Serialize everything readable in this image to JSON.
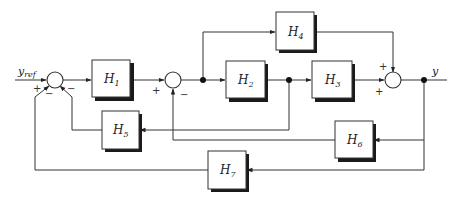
{
  "diagram": {
    "type": "block-diagram",
    "signals": {
      "input": {
        "name": "y",
        "subscript": "ref"
      },
      "output": {
        "name": "y"
      }
    },
    "blocks": [
      {
        "id": "H1",
        "name": "H",
        "sub": "1"
      },
      {
        "id": "H2",
        "name": "H",
        "sub": "2"
      },
      {
        "id": "H3",
        "name": "H",
        "sub": "3"
      },
      {
        "id": "H4",
        "name": "H",
        "sub": "4"
      },
      {
        "id": "H5",
        "name": "H",
        "sub": "5"
      },
      {
        "id": "H6",
        "name": "H",
        "sub": "6"
      },
      {
        "id": "H7",
        "name": "H",
        "sub": "7"
      }
    ],
    "summing_junctions": [
      {
        "id": "S1",
        "signs": {
          "left": "+",
          "bottom_left": "−",
          "bottom_right": "−"
        }
      },
      {
        "id": "S2",
        "signs": {
          "left": "+",
          "bottom": "−"
        }
      },
      {
        "id": "S3",
        "signs": {
          "top": "+",
          "left": "+"
        }
      }
    ],
    "connections": [
      "y_ref → S1 (+)",
      "S1 → H1",
      "H1 → S2 (+)",
      "S2 → branch A",
      "branch A → H2",
      "branch A → H4",
      "H2 → branch B",
      "branch B → H3",
      "branch B → H5",
      "H5 → S1 (−)",
      "H3 → S3 (+)",
      "H4 → S3 (+)",
      "S3 → branch C (y)",
      "branch C → H6",
      "H6 → S2 (−)",
      "branch C → H7",
      "H7 → S1 (−)"
    ]
  }
}
